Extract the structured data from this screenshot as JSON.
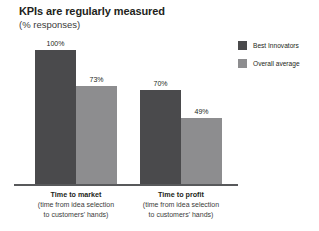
{
  "chart_data": {
    "type": "bar",
    "title": "KPIs are regularly measured",
    "subtitle": "(% responses)",
    "xlabel": "",
    "ylabel": "",
    "ylim": [
      0,
      100
    ],
    "grid": false,
    "legend_position": "right",
    "categories": [
      "Time to market",
      "Time to profit"
    ],
    "category_sublabels": [
      [
        "(time from idea selection",
        "to customers' hands)"
      ],
      [
        "(time from idea selection",
        "to customers' hands)"
      ]
    ],
    "series": [
      {
        "name": "Best Innovators",
        "color": "#4a4a4c",
        "values": [
          100,
          70
        ],
        "value_labels": [
          "100%",
          "70%"
        ]
      },
      {
        "name": "Overall average",
        "color": "#8d8d8f",
        "values": [
          73,
          49
        ],
        "value_labels": [
          "73%",
          "49%"
        ]
      }
    ],
    "axis_color": "#58595b"
  },
  "legend": {
    "items": [
      {
        "label": "Best Innovators",
        "color": "#4a4a4c"
      },
      {
        "label": "Overall average",
        "color": "#8d8d8f"
      }
    ]
  }
}
